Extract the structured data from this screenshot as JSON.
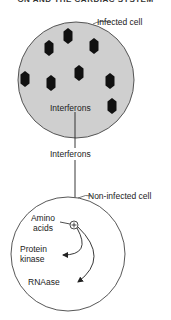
{
  "header": {
    "text": "ON AND THE CARDIAC SYSTEM"
  },
  "infected_cell": {
    "label": "Infected cell",
    "inner_label": "Interferons",
    "fill_color": "#cfcfcf",
    "virus_count": 8
  },
  "connector": {
    "label": "Interferons"
  },
  "non_infected_cell": {
    "label": "Non-infected cell",
    "stimulus_symbol": "+",
    "inputs": [
      {
        "label_line1": "Amino",
        "label_line2": "acids"
      }
    ],
    "products": [
      {
        "label_line1": "Protein",
        "label_line2": "kinase"
      },
      {
        "label_line1": "RNAase"
      }
    ]
  }
}
